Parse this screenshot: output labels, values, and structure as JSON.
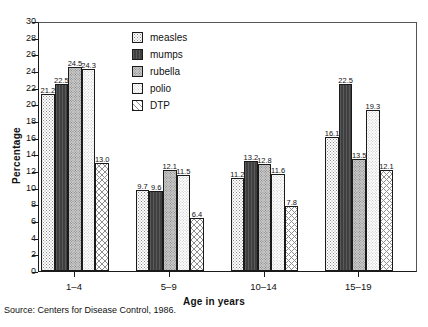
{
  "chart_data": {
    "type": "bar",
    "title": "",
    "subtitle": "",
    "xlabel": "Age in years",
    "ylabel": "Percentage",
    "categories": [
      "1–4",
      "5–9",
      "10–14",
      "15–19"
    ],
    "series": [
      {
        "name": "measles",
        "values": [
          21.2,
          9.7,
          11.2,
          16.1
        ]
      },
      {
        "name": "mumps",
        "values": [
          22.5,
          9.6,
          13.2,
          22.5
        ]
      },
      {
        "name": "rubella",
        "values": [
          24.5,
          12.1,
          12.8,
          13.5
        ]
      },
      {
        "name": "polio",
        "values": [
          24.3,
          11.5,
          11.6,
          19.3
        ]
      },
      {
        "name": "DTP",
        "values": [
          13.0,
          6.4,
          7.8,
          12.1
        ]
      }
    ],
    "ylim": [
      0,
      30
    ],
    "ytick_step": 2,
    "yticks": [
      0,
      2,
      4,
      6,
      8,
      10,
      12,
      14,
      16,
      18,
      20,
      22,
      24,
      26,
      28,
      30
    ],
    "grid": false,
    "legend_position": "upper-center",
    "data_labels": true
  },
  "legend": {
    "items": [
      {
        "label": "measles",
        "pattern": "fine-dot"
      },
      {
        "label": "mumps",
        "pattern": "solid-dark"
      },
      {
        "label": "rubella",
        "pattern": "gray-dot"
      },
      {
        "label": "polio",
        "pattern": "light-dot"
      },
      {
        "label": "DTP",
        "pattern": "diagonal-hatch"
      }
    ]
  },
  "source": {
    "text": "Source: Centers for Disease Control, 1986."
  }
}
